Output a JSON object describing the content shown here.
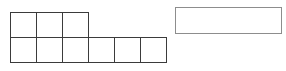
{
  "figure": {
    "type": "polyomino-grid-and-rectangle",
    "background_color": "#ffffff",
    "grid": {
      "label": "polyomino-grid",
      "cell_width": 27,
      "cell_height": 26,
      "line_color": "#3b3b3b",
      "rows": [
        {
          "name": "top-row",
          "cell_count": 3,
          "cells": [
            "",
            "",
            ""
          ]
        },
        {
          "name": "bottom-row",
          "cell_count": 6,
          "cells": [
            "",
            "",
            "",
            "",
            "",
            ""
          ]
        }
      ],
      "total_cells": 9
    },
    "rectangle": {
      "label": "empty-rectangle",
      "width": 107,
      "height": 27,
      "border_color": "#8d8d8d",
      "fill_color": "#ffffff",
      "text": ""
    }
  }
}
